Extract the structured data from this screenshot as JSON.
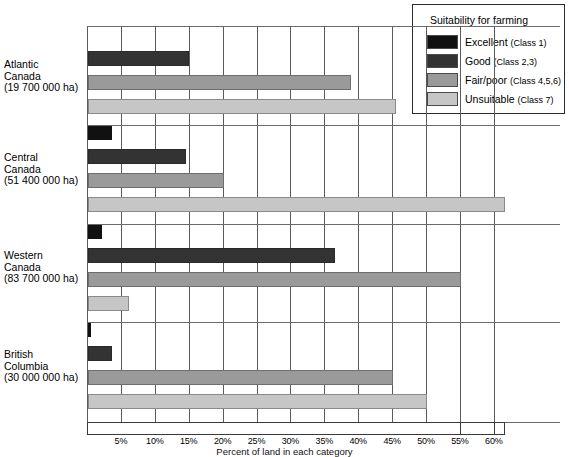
{
  "legend": {
    "title": "Suitability for farming",
    "items": [
      {
        "label": "Excellent",
        "class": "(Class 1)",
        "color": "#111111",
        "key": "excellent"
      },
      {
        "label": "Good",
        "class": "(Class 2,3)",
        "color": "#333333",
        "key": "good"
      },
      {
        "label": "Fair/poor",
        "class": "(Class 4,5,6)",
        "color": "#9a9a9a",
        "key": "fair"
      },
      {
        "label": "Unsuitable",
        "class": "(Class 7)",
        "color": "#c6c6c6",
        "key": "unsuitable"
      }
    ]
  },
  "axis": {
    "title": "Percent of land in each category",
    "ticks": [
      "5%",
      "10%",
      "15%",
      "20%",
      "25%",
      "30%",
      "35%",
      "40%",
      "45%",
      "50%",
      "55%",
      "60%"
    ]
  },
  "groups": [
    {
      "name": "Atlantic Canada",
      "line1": "Atlantic",
      "line2": "Canada",
      "area": "(19 700 000 ha)"
    },
    {
      "name": "Central Canada",
      "line1": "Central",
      "line2": "Canada",
      "area": "(51 400 000 ha)"
    },
    {
      "name": "Western Canada",
      "line1": "Western",
      "line2": "Canada",
      "area": "(83 700 000 ha)"
    },
    {
      "name": "British Columbia",
      "line1": "British",
      "line2": "Columbia",
      "area": "(30 000 000 ha)"
    }
  ],
  "chart_data": {
    "type": "bar",
    "orientation": "horizontal",
    "title": "",
    "xlabel": "Percent of land in each category",
    "ylabel": "",
    "xlim": [
      0,
      62
    ],
    "grid": true,
    "legend_position": "top-right",
    "categories": [
      "Atlantic Canada (19 700 000 ha)",
      "Central Canada (51 400 000 ha)",
      "Western Canada (83 700 000 ha)",
      "British Columbia (30 000 000 ha)"
    ],
    "series": [
      {
        "name": "Excellent (Class 1)",
        "color": "#111111",
        "values": [
          0,
          3.5,
          2.0,
          0.5
        ]
      },
      {
        "name": "Good (Class 2,3)",
        "color": "#333333",
        "values": [
          14.9,
          14.5,
          36.5,
          3.5
        ]
      },
      {
        "name": "Fair/poor (Class 4,5,6)",
        "color": "#9a9a9a",
        "values": [
          38.8,
          20.0,
          55.0,
          45.0
        ]
      },
      {
        "name": "Unsuitable (Class 7)",
        "color": "#c6c6c6",
        "values": [
          45.4,
          61.5,
          6.0,
          50.0
        ]
      }
    ]
  }
}
